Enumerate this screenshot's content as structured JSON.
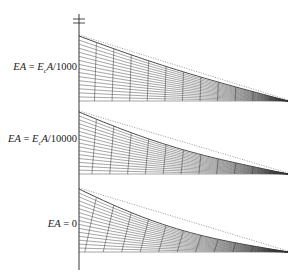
{
  "figure": {
    "type": "diagram",
    "axis": {
      "x": 79,
      "top": 14,
      "bottom": 270,
      "break_ticks_y": [
        19,
        23
      ]
    },
    "panels": [
      {
        "id": "panel-1",
        "label": {
          "lhs": "EA",
          "eq": "=",
          "rhs_base": "E",
          "rhs_sub": "c",
          "rhs_tail": "A/1000"
        },
        "label_y": 68,
        "top_y": 36,
        "base_y": 101,
        "end_x": 288,
        "sag": 4,
        "fan": 0.15
      },
      {
        "id": "panel-2",
        "label": {
          "lhs": "EA",
          "eq": "=",
          "rhs_base": "E",
          "rhs_sub": "c",
          "rhs_tail": "A/10000"
        },
        "label_y": 140,
        "top_y": 112,
        "base_y": 174,
        "end_x": 288,
        "sag": 8,
        "fan": 0.35
      },
      {
        "id": "panel-3",
        "label": {
          "lhs": "EA",
          "eq": "=",
          "rhs_text": "0"
        },
        "label_y": 225,
        "top_y": 189,
        "base_y": 252,
        "end_x": 288,
        "sag": 12,
        "fan": 0.7
      }
    ],
    "colors": {
      "line": "#222222",
      "mesh": "#333333",
      "dotted": "#555555"
    }
  }
}
